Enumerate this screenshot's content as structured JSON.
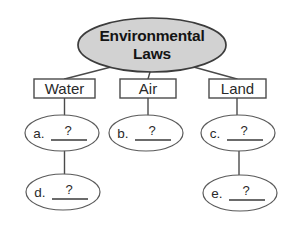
{
  "diagram": {
    "root": {
      "label_line1": "Environmental",
      "label_line2": "Laws",
      "shape": "ellipse",
      "fill": "#d2d2d2",
      "stroke": "#3c3c3c"
    },
    "categories": [
      {
        "label": "Water",
        "shape": "rectangle"
      },
      {
        "label": "Air",
        "shape": "rectangle"
      },
      {
        "label": "Land",
        "shape": "rectangle"
      }
    ],
    "answer_blanks": [
      {
        "letter": "a.",
        "value": "?",
        "shape": "ellipse",
        "parent": "Water"
      },
      {
        "letter": "b.",
        "value": "?",
        "shape": "ellipse",
        "parent": "Air"
      },
      {
        "letter": "c.",
        "value": "?",
        "shape": "ellipse",
        "parent": "Land"
      },
      {
        "letter": "d.",
        "value": "?",
        "shape": "ellipse",
        "parent": "a."
      },
      {
        "letter": "e.",
        "value": "?",
        "shape": "ellipse",
        "parent": "c."
      }
    ],
    "colors": {
      "background": "#ffffff",
      "line": "#4a4a4a",
      "text": "#1a1a1a",
      "root_fill": "#d2d2d2"
    }
  }
}
